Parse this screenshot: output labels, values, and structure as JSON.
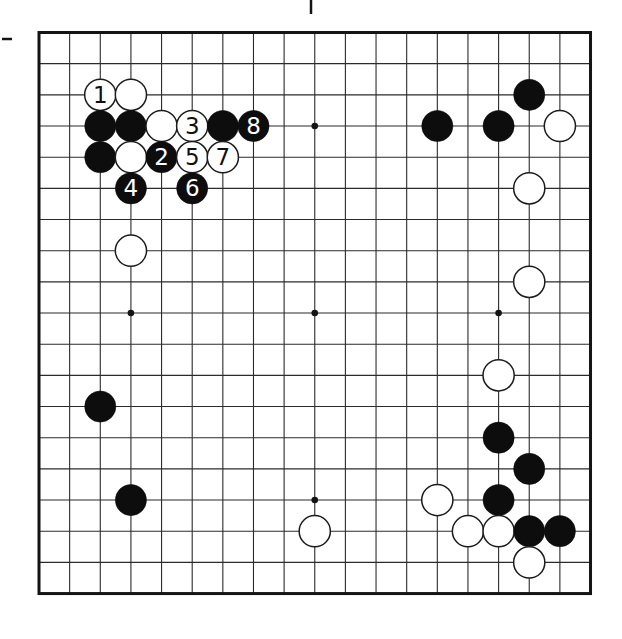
{
  "diagram": {
    "type": "go-board-diagram",
    "board_size": 19,
    "visible_star_points": [
      {
        "col": 9,
        "row": 3
      },
      {
        "col": 3,
        "row": 9
      },
      {
        "col": 9,
        "row": 9
      },
      {
        "col": 15,
        "row": 9
      },
      {
        "col": 9,
        "row": 15
      }
    ],
    "stones": [
      {
        "col": 2,
        "row": 2,
        "color": "white",
        "label": "1"
      },
      {
        "col": 3,
        "row": 2,
        "color": "white",
        "label": ""
      },
      {
        "col": 2,
        "row": 3,
        "color": "black",
        "label": ""
      },
      {
        "col": 3,
        "row": 3,
        "color": "black",
        "label": ""
      },
      {
        "col": 4,
        "row": 3,
        "color": "white",
        "label": ""
      },
      {
        "col": 5,
        "row": 3,
        "color": "white",
        "label": "3"
      },
      {
        "col": 6,
        "row": 3,
        "color": "black",
        "label": ""
      },
      {
        "col": 7,
        "row": 3,
        "color": "black",
        "label": "8"
      },
      {
        "col": 2,
        "row": 4,
        "color": "black",
        "label": ""
      },
      {
        "col": 3,
        "row": 4,
        "color": "white",
        "label": ""
      },
      {
        "col": 4,
        "row": 4,
        "color": "black",
        "label": "2"
      },
      {
        "col": 5,
        "row": 4,
        "color": "white",
        "label": "5"
      },
      {
        "col": 6,
        "row": 4,
        "color": "white",
        "label": "7"
      },
      {
        "col": 3,
        "row": 5,
        "color": "black",
        "label": "4"
      },
      {
        "col": 5,
        "row": 5,
        "color": "black",
        "label": "6"
      },
      {
        "col": 3,
        "row": 7,
        "color": "white",
        "label": ""
      },
      {
        "col": 16,
        "row": 2,
        "color": "black",
        "label": ""
      },
      {
        "col": 13,
        "row": 3,
        "color": "black",
        "label": ""
      },
      {
        "col": 15,
        "row": 3,
        "color": "black",
        "label": ""
      },
      {
        "col": 17,
        "row": 3,
        "color": "white",
        "label": ""
      },
      {
        "col": 16,
        "row": 5,
        "color": "white",
        "label": ""
      },
      {
        "col": 16,
        "row": 8,
        "color": "white",
        "label": ""
      },
      {
        "col": 15,
        "row": 11,
        "color": "white",
        "label": ""
      },
      {
        "col": 2,
        "row": 12,
        "color": "black",
        "label": ""
      },
      {
        "col": 15,
        "row": 13,
        "color": "black",
        "label": ""
      },
      {
        "col": 16,
        "row": 14,
        "color": "black",
        "label": ""
      },
      {
        "col": 3,
        "row": 15,
        "color": "black",
        "label": ""
      },
      {
        "col": 13,
        "row": 15,
        "color": "white",
        "label": ""
      },
      {
        "col": 15,
        "row": 15,
        "color": "black",
        "label": ""
      },
      {
        "col": 9,
        "row": 16,
        "color": "white",
        "label": ""
      },
      {
        "col": 14,
        "row": 16,
        "color": "white",
        "label": ""
      },
      {
        "col": 15,
        "row": 16,
        "color": "white",
        "label": ""
      },
      {
        "col": 16,
        "row": 16,
        "color": "black",
        "label": ""
      },
      {
        "col": 17,
        "row": 16,
        "color": "black",
        "label": ""
      },
      {
        "col": 16,
        "row": 17,
        "color": "white",
        "label": ""
      }
    ],
    "colors": {
      "background": "#ffffff",
      "grid_line": "#2b2b2b",
      "board_border": "#141414",
      "black_stone": "#0d0d0d",
      "white_stone": "#ffffff",
      "white_stone_outline": "#1c1c1c",
      "label_on_black": "#ffffff",
      "label_on_white": "#111111"
    },
    "print_artifacts": [
      {
        "kind": "tick-vertical",
        "x": 311,
        "y": 0,
        "length": 14
      },
      {
        "kind": "tick-horizontal",
        "x": 2,
        "y": 39,
        "length": 10
      }
    ]
  }
}
